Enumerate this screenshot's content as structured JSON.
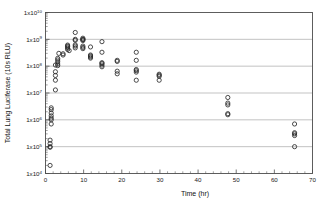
{
  "chart_data": {
    "type": "scatter",
    "title": "",
    "xlabel": "Time (hr)",
    "ylabel": "Total Lung Luciferase (10s RLU)",
    "xlim": [
      0,
      70
    ],
    "ylim": [
      10000,
      10000000000
    ],
    "yscale": "log",
    "xscale": "linear",
    "grid": "horizontal-major",
    "legend": "none",
    "marker_style": "open-circle",
    "marker_color": "#2b2b2b",
    "xticks": [
      0,
      10,
      20,
      30,
      40,
      50,
      60,
      70
    ],
    "xtick_labels": [
      "0",
      "10",
      "20",
      "30",
      "40",
      "50",
      "60",
      "70"
    ],
    "xtick_minor_interval": 2,
    "yticks": [
      10000,
      100000,
      1000000,
      10000000,
      100000000,
      1000000000,
      10000000000
    ],
    "ytick_labels": [
      "1x10⁴",
      "1x10⁵",
      "1x10⁶",
      "1x10⁷",
      "1x10⁸",
      "1x10⁹",
      "1x10¹⁰"
    ],
    "ytick_mantissa": "1x10",
    "ytick_exponents": [
      "4",
      "5",
      "6",
      "7",
      "8",
      "9",
      "10"
    ],
    "points": [
      {
        "x": 1.2,
        "y": 20000
      },
      {
        "x": 1.2,
        "y": 95000
      },
      {
        "x": 1.2,
        "y": 100000
      },
      {
        "x": 1.2,
        "y": 130000
      },
      {
        "x": 1.2,
        "y": 175000
      },
      {
        "x": 1.5,
        "y": 700000
      },
      {
        "x": 1.5,
        "y": 1000000
      },
      {
        "x": 1.5,
        "y": 1150000
      },
      {
        "x": 1.5,
        "y": 1400000
      },
      {
        "x": 1.5,
        "y": 1800000
      },
      {
        "x": 1.5,
        "y": 2400000
      },
      {
        "x": 1.5,
        "y": 2800000
      },
      {
        "x": 2.6,
        "y": 13000000
      },
      {
        "x": 2.6,
        "y": 30000000
      },
      {
        "x": 2.6,
        "y": 45000000
      },
      {
        "x": 2.6,
        "y": 62000000
      },
      {
        "x": 2.6,
        "y": 110000000
      },
      {
        "x": 3.2,
        "y": 105000000
      },
      {
        "x": 3.2,
        "y": 120000000
      },
      {
        "x": 3.2,
        "y": 145000000
      },
      {
        "x": 3.2,
        "y": 170000000
      },
      {
        "x": 3.2,
        "y": 195000000
      },
      {
        "x": 3.5,
        "y": 300000000
      },
      {
        "x": 4.6,
        "y": 260000000
      },
      {
        "x": 4.6,
        "y": 290000000
      },
      {
        "x": 5.8,
        "y": 420000000
      },
      {
        "x": 5.8,
        "y": 470000000
      },
      {
        "x": 5.8,
        "y": 520000000
      },
      {
        "x": 5.8,
        "y": 560000000
      },
      {
        "x": 5.8,
        "y": 610000000
      },
      {
        "x": 6.2,
        "y": 380000000
      },
      {
        "x": 7.8,
        "y": 1800000000
      },
      {
        "x": 7.8,
        "y": 1000000000
      },
      {
        "x": 7.8,
        "y": 920000000
      },
      {
        "x": 7.8,
        "y": 620000000
      },
      {
        "x": 7.8,
        "y": 560000000
      },
      {
        "x": 7.8,
        "y": 480000000
      },
      {
        "x": 9.8,
        "y": 1100000000
      },
      {
        "x": 9.8,
        "y": 1000000000
      },
      {
        "x": 9.8,
        "y": 980000000
      },
      {
        "x": 9.8,
        "y": 900000000
      },
      {
        "x": 9.8,
        "y": 560000000
      },
      {
        "x": 9.8,
        "y": 500000000
      },
      {
        "x": 9.8,
        "y": 450000000
      },
      {
        "x": 11.8,
        "y": 520000000
      },
      {
        "x": 11.8,
        "y": 260000000
      },
      {
        "x": 11.8,
        "y": 240000000
      },
      {
        "x": 11.8,
        "y": 220000000
      },
      {
        "x": 11.8,
        "y": 200000000
      },
      {
        "x": 14.8,
        "y": 820000000
      },
      {
        "x": 14.8,
        "y": 330000000
      },
      {
        "x": 14.8,
        "y": 135000000
      },
      {
        "x": 14.8,
        "y": 125000000
      },
      {
        "x": 14.8,
        "y": 110000000
      },
      {
        "x": 14.8,
        "y": 95000000
      },
      {
        "x": 18.8,
        "y": 165000000
      },
      {
        "x": 18.8,
        "y": 150000000
      },
      {
        "x": 18.8,
        "y": 65000000
      },
      {
        "x": 18.8,
        "y": 52000000
      },
      {
        "x": 23.8,
        "y": 330000000
      },
      {
        "x": 23.8,
        "y": 165000000
      },
      {
        "x": 23.8,
        "y": 75000000
      },
      {
        "x": 23.8,
        "y": 68000000
      },
      {
        "x": 23.8,
        "y": 60000000
      },
      {
        "x": 23.8,
        "y": 30000000
      },
      {
        "x": 29.8,
        "y": 50000000
      },
      {
        "x": 29.8,
        "y": 46000000
      },
      {
        "x": 29.8,
        "y": 42000000
      },
      {
        "x": 29.8,
        "y": 30000000
      },
      {
        "x": 47.8,
        "y": 6800000
      },
      {
        "x": 47.8,
        "y": 4200000
      },
      {
        "x": 47.8,
        "y": 3600000
      },
      {
        "x": 47.8,
        "y": 1700000
      },
      {
        "x": 47.8,
        "y": 1550000
      },
      {
        "x": 65.3,
        "y": 700000
      },
      {
        "x": 65.3,
        "y": 330000
      },
      {
        "x": 65.3,
        "y": 300000
      },
      {
        "x": 65.3,
        "y": 260000
      },
      {
        "x": 65.3,
        "y": 100000
      }
    ]
  }
}
